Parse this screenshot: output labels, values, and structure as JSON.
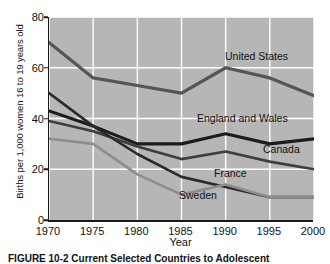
{
  "figure": {
    "caption": "FIGURE 10-2  Current Selected Countries to Adolescent"
  },
  "chart_data": {
    "type": "line",
    "title": "",
    "xlabel": "Year",
    "ylabel": "Births per 1,000 women 16 to 19 years old",
    "x": [
      1970,
      1975,
      1980,
      1985,
      1990,
      1995,
      2000
    ],
    "xticklabels": [
      "1970",
      "1975",
      "1980",
      "1985",
      "1990",
      "1995",
      "2000"
    ],
    "yticklabels": [
      "0",
      "20",
      "40",
      "60",
      "80"
    ],
    "yticks": [
      0,
      20,
      40,
      60,
      80
    ],
    "xlim": [
      1970,
      2000
    ],
    "ylim": [
      0,
      80
    ],
    "grid": true,
    "grid_color": "#ffffff",
    "plot_background": "#b6b6b6",
    "legend_position": "inline-labels",
    "series": [
      {
        "name": "United States",
        "values": [
          70,
          56,
          53,
          50,
          60,
          56,
          49
        ],
        "color": "#555555",
        "width": 3.2,
        "label_x": 224,
        "label_y": 50
      },
      {
        "name": "England and Wales",
        "values": [
          43,
          37,
          30,
          30,
          34,
          30,
          32
        ],
        "color": "#1c1c1c",
        "width": 3.2,
        "label_x": 196,
        "label_y": 112
      },
      {
        "name": "Canada",
        "values": [
          39,
          35,
          29,
          24,
          27,
          23,
          20
        ],
        "color": "#3d3d3d",
        "width": 2.6,
        "label_x": 262,
        "label_y": 143
      },
      {
        "name": "France",
        "values": [
          50,
          37,
          26,
          17,
          13,
          9,
          9
        ],
        "color": "#2a2a2a",
        "width": 2.6,
        "label_x": 213,
        "label_y": 167
      },
      {
        "name": "Sweden",
        "values": [
          32,
          30,
          18,
          10,
          14,
          9,
          9
        ],
        "color": "#8d8d8d",
        "width": 2.6,
        "label_x": 178,
        "label_y": 189
      }
    ]
  }
}
